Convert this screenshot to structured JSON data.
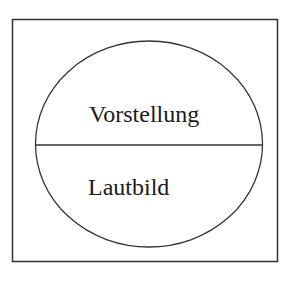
{
  "diagram": {
    "type": "saussurean-sign",
    "upper_label": "Vorstellung",
    "lower_label": "Lautbild",
    "stroke_color": "#333333",
    "background": "#ffffff"
  }
}
